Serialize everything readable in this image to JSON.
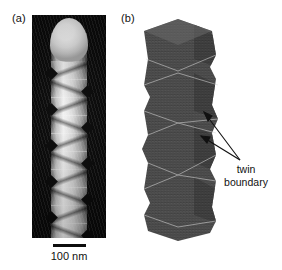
{
  "figure": {
    "type": "scientific-figure",
    "background_color": "#ffffff"
  },
  "panels": [
    {
      "id": "a",
      "label": "(a)",
      "kind": "sem-micrograph",
      "background_color": "#050505",
      "subject": "nanowire",
      "features": "bright rounded tip with periodic zigzag sawtooth sidewall facets",
      "scalebar": {
        "label": "100 nm",
        "value": 100,
        "unit": "nm",
        "color": "#0d0d0d"
      }
    },
    {
      "id": "b",
      "label": "(b)",
      "kind": "atomistic-model",
      "background_color": "#ffffff",
      "atom_color": "#4a4a4a",
      "subject": "faceted twinned nanowire built from stacked hexagonal segments",
      "annotation": {
        "lines": [
          "twin",
          "boundary"
        ],
        "line1": "twin",
        "line2": "boundary",
        "arrow_count": 2,
        "arrow_color": "#111111"
      }
    }
  ],
  "labels": {
    "panel_a": "(a)",
    "panel_b": "(b)",
    "scalebar": "100 nm",
    "twin_line1": "twin",
    "twin_line2": "boundary"
  }
}
